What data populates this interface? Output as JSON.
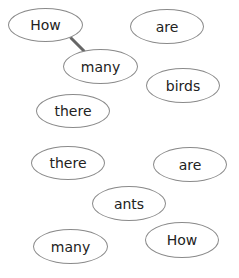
{
  "words": [
    {
      "text": "How",
      "x": 8,
      "y": 8,
      "w": 75,
      "h": 34
    },
    {
      "text": "are",
      "x": 130,
      "y": 9,
      "w": 74,
      "h": 35
    },
    {
      "text": "many",
      "x": 63,
      "y": 49,
      "w": 75,
      "h": 35
    },
    {
      "text": "birds",
      "x": 146,
      "y": 68,
      "w": 74,
      "h": 35
    },
    {
      "text": "there",
      "x": 36,
      "y": 94,
      "w": 74,
      "h": 34
    },
    {
      "text": "there",
      "x": 31,
      "y": 146,
      "w": 74,
      "h": 34
    },
    {
      "text": "are",
      "x": 153,
      "y": 147,
      "w": 74,
      "h": 35
    },
    {
      "text": "ants",
      "x": 92,
      "y": 186,
      "w": 74,
      "h": 35
    },
    {
      "text": "many",
      "x": 33,
      "y": 229,
      "w": 75,
      "h": 35
    },
    {
      "text": "How",
      "x": 145,
      "y": 222,
      "w": 74,
      "h": 36
    }
  ],
  "links": [
    {
      "from": 0,
      "to": 2,
      "x1": 71,
      "y1": 38,
      "x2": 84,
      "y2": 51,
      "color": "#666666"
    }
  ]
}
